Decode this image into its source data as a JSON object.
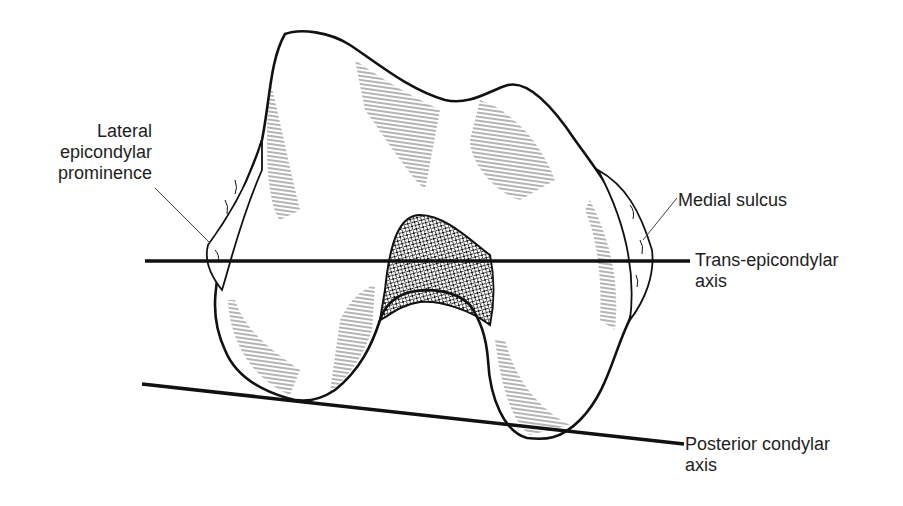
{
  "figure": {
    "labels": {
      "lateral_epicondylar_prominence": [
        "Lateral",
        "epicondylar",
        "prominence"
      ],
      "medial_sulcus": [
        "Medial sulcus"
      ],
      "trans_epicondylar_axis": [
        "Trans-epicondylar",
        "axis"
      ],
      "posterior_condylar_axis": [
        "Posterior condylar",
        "axis"
      ]
    },
    "colors": {
      "ink": "#111111",
      "label_text": "#1e1e1e",
      "background": "#ffffff"
    }
  }
}
